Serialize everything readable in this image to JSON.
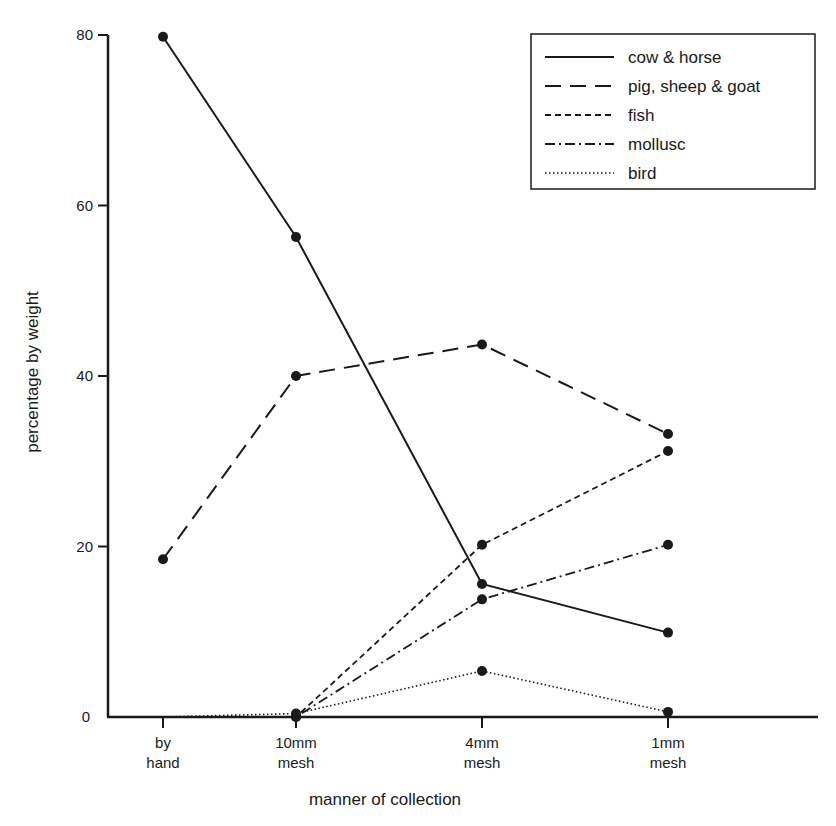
{
  "chart_data": {
    "type": "line",
    "title": "",
    "xlabel": "manner of collection",
    "ylabel": "percentage by weight",
    "categories": [
      "by hand",
      "10mm mesh",
      "4mm mesh",
      "1mm mesh"
    ],
    "category_lines": [
      [
        "by",
        "hand"
      ],
      [
        "10mm",
        "mesh"
      ],
      [
        "4mm",
        "mesh"
      ],
      [
        "1mm",
        "mesh"
      ]
    ],
    "ylim": [
      0,
      80
    ],
    "yticks": [
      0,
      20,
      40,
      60,
      80
    ],
    "grid": false,
    "legend_position": "top-right",
    "series": [
      {
        "name": "cow & horse",
        "style": "solid",
        "values": [
          79.8,
          56.3,
          15.6,
          9.9
        ],
        "markers": [
          true,
          true,
          true,
          true
        ]
      },
      {
        "name": "pig, sheep & goat",
        "style": "long-dash",
        "values": [
          18.5,
          40.0,
          43.7,
          33.2
        ],
        "markers": [
          true,
          true,
          true,
          true
        ]
      },
      {
        "name": "fish",
        "style": "short-dash",
        "values": [
          0,
          0,
          20.2,
          31.2
        ],
        "markers": [
          false,
          true,
          true,
          true
        ]
      },
      {
        "name": "mollusc",
        "style": "dash-dot",
        "values": [
          0,
          0,
          13.8,
          20.2
        ],
        "markers": [
          false,
          true,
          true,
          true
        ]
      },
      {
        "name": "bird",
        "style": "dotted",
        "values": [
          0,
          0.4,
          5.4,
          0.6
        ],
        "markers": [
          false,
          true,
          true,
          true
        ]
      }
    ]
  },
  "colors": {
    "ink": "#1a1a1a",
    "background": "#ffffff"
  }
}
